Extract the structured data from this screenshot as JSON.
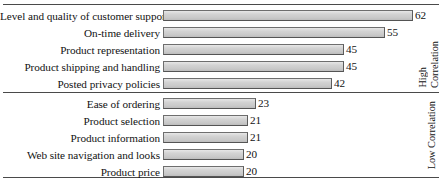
{
  "chart_data": {
    "type": "bar",
    "orientation": "horizontal",
    "title": "",
    "subtitle": "",
    "xlabel": "",
    "ylabel": "",
    "xlim": [
      0,
      62
    ],
    "grid": false,
    "legend_position": "right",
    "data_labels": true,
    "groups": [
      {
        "caption_lines": [
          "High",
          "Correlation"
        ],
        "caption": "High Correlation",
        "categories": [
          "Level and quality of customer support",
          "On-time delivery",
          "Product representation",
          "Product shipping and handling",
          "Posted privacy policies"
        ],
        "values": [
          62,
          55,
          45,
          45,
          42
        ]
      },
      {
        "caption_lines": [
          "Low Correlation"
        ],
        "caption": "Low Correlation",
        "categories": [
          "Ease of ordering",
          "Product selection",
          "Product information",
          "Web site navigation and looks",
          "Product price"
        ],
        "values": [
          23,
          21,
          21,
          20,
          20
        ]
      }
    ],
    "colors": {
      "bar_fill": "#d3d3d3",
      "bar_border": "#6e6e6e",
      "text": "#121212",
      "rule": "#4a4a4a",
      "background": "#ffffff"
    },
    "scale_px_per_unit": 4.03
  }
}
